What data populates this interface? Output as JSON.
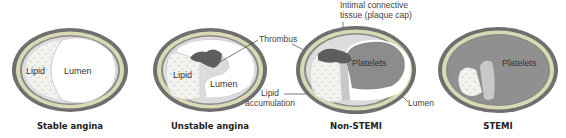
{
  "diagram": {
    "panels": [
      {
        "caption": "Stable angina",
        "inner_labels": [
          "Lipid",
          "Lumen"
        ]
      },
      {
        "caption": "Unstable angina",
        "inner_labels": [
          "Lipid",
          "Lumen"
        ]
      },
      {
        "caption": "Non-STEMI",
        "inner_labels": [
          "Platelets"
        ]
      },
      {
        "caption": "STEMI",
        "inner_labels": [
          "Platelets"
        ]
      }
    ],
    "callouts": {
      "thrombus": "Thrombus",
      "intimal_1": "Intimal connective",
      "intimal_2": "tissue (plaque cap)",
      "lipid_1": "Lipid",
      "lipid_2": "accumulation",
      "lumen": "Lumen"
    },
    "colors": {
      "outer_wall": "#7a7a7a",
      "media": "#d4d4a8",
      "intima": "#e6e6e6",
      "lipid": "#f0f0ec",
      "thrombus": "#5e5e5e",
      "platelets": "#8c8c8c",
      "cap": "#c8c8c8"
    }
  }
}
